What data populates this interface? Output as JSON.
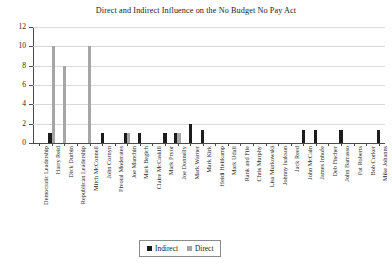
{
  "chart_data": {
    "type": "bar",
    "title": "Direct and Indirect Influence on the No Budget No Pay Act",
    "xlabel": "",
    "ylabel": "",
    "ylim": [
      0,
      12
    ],
    "yticks": [
      0,
      2,
      4,
      6,
      8,
      10,
      12
    ],
    "grid": true,
    "legend_position": "bottom-center",
    "categories": [
      "Democratic Leadership",
      "Harry Reid",
      "Dick Durbin",
      "Republican Leadership",
      "Mitch McConnell",
      "John Cornyn",
      "Pivotal Moderates",
      "Joe Manchin",
      "Mark Begich",
      "Claire McCaskill",
      "Mark Pryor",
      "Joe Donnelly",
      "Mark Warner",
      "Mark Kirk",
      "Heidi Heitkamp",
      "Mark Udall",
      "Rank and File",
      "Chris Murphy",
      "Lisa Murkowski",
      "Johnny Isakson",
      "Jack Reed",
      "John McCain",
      "James Inhofe",
      "Deb Fischer",
      "John Barrasso",
      "Pat Roberts",
      "Bob Corker",
      "Mike Johanns"
    ],
    "series": [
      {
        "name": "Indirect",
        "color": "#1c1c1c",
        "values": [
          0,
          1,
          0,
          0,
          0,
          1,
          0,
          1,
          1,
          0,
          1,
          1,
          2,
          1.3,
          0,
          0,
          0,
          0,
          0,
          0,
          0,
          1.3,
          1.3,
          0,
          1.3,
          0,
          0,
          1.3
        ]
      },
      {
        "name": "Direct",
        "color": "#a6a6a6",
        "values": [
          0,
          10,
          8,
          0,
          10,
          0,
          0,
          1,
          0,
          0,
          0,
          1,
          0,
          0,
          0,
          0,
          0,
          0,
          0,
          0,
          0,
          0,
          0,
          0,
          0,
          0,
          0,
          0
        ]
      }
    ],
    "legend": [
      {
        "label": "Indirect",
        "color": "#1c1c1c"
      },
      {
        "label": "Direct",
        "color": "#a6a6a6"
      }
    ]
  }
}
